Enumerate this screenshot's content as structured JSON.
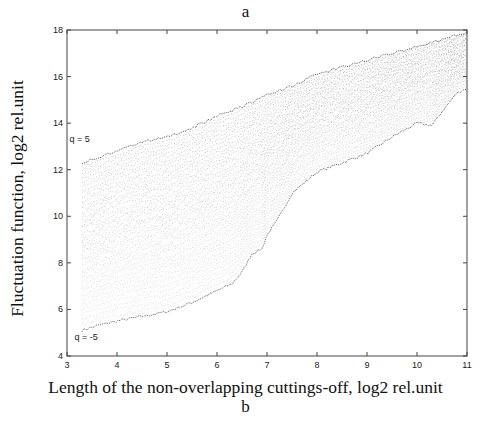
{
  "figure": {
    "panel_title": "a",
    "caption": "b",
    "ylabel": "Fluctuation function, log2 rel.unit",
    "xlabel": "Length of the non-overlapping cuttings-off, log2 rel.unit",
    "annotations": [
      {
        "text": "q = 5",
        "x": 3.25,
        "y": 13.2
      },
      {
        "text": "q = -5",
        "x": 3.35,
        "y": 4.7
      }
    ]
  },
  "chart_data": {
    "type": "line",
    "title": "a",
    "xlabel": "Length of the non-overlapping cuttings-off, log2 rel.unit",
    "ylabel": "Fluctuation function, log2 rel.unit",
    "xlim": [
      3,
      11
    ],
    "ylim": [
      4,
      18
    ],
    "xticks": [
      3,
      4,
      5,
      6,
      7,
      8,
      9,
      10,
      11
    ],
    "yticks": [
      4,
      6,
      8,
      10,
      12,
      14,
      16,
      18
    ],
    "grid": false,
    "legend": null,
    "q_range": [
      -5,
      5
    ],
    "series": [
      {
        "name": "q = 5 (upper envelope)",
        "x": [
          3.3,
          3.6,
          4.0,
          4.5,
          5.0,
          5.5,
          6.0,
          6.5,
          7.0,
          7.5,
          8.0,
          8.5,
          9.0,
          9.5,
          10.0,
          10.5,
          11.0
        ],
        "values": [
          12.3,
          12.5,
          12.8,
          13.2,
          13.4,
          13.8,
          14.3,
          14.7,
          15.2,
          15.6,
          16.1,
          16.4,
          16.7,
          17.0,
          17.3,
          17.6,
          17.9
        ]
      },
      {
        "name": "q = -5 (lower envelope)",
        "x": [
          3.3,
          3.6,
          4.0,
          4.5,
          5.0,
          5.5,
          6.0,
          6.3,
          6.5,
          6.7,
          6.9,
          7.0,
          7.2,
          7.5,
          8.0,
          8.5,
          9.0,
          9.5,
          10.0,
          10.3,
          10.5,
          10.8,
          11.0
        ],
        "values": [
          5.1,
          5.3,
          5.5,
          5.7,
          5.9,
          6.3,
          6.8,
          7.1,
          7.6,
          8.4,
          8.6,
          9.2,
          9.8,
          11.0,
          11.9,
          12.3,
          12.7,
          13.4,
          14.0,
          13.9,
          14.5,
          15.3,
          15.5
        ]
      }
    ],
    "intermediate_curve_count": 40
  }
}
